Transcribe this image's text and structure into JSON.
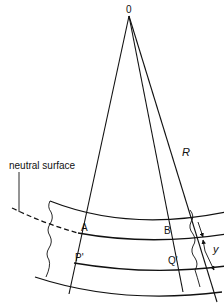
{
  "diagram": {
    "labels": {
      "origin": "0",
      "radius": "R",
      "neutral_surface": "neutral surface",
      "point_a": "A",
      "point_b": "B",
      "point_p": "P'",
      "point_q": "Q'",
      "distance": "y"
    },
    "colors": {
      "line": "#111111",
      "background": "#ffffff"
    }
  }
}
